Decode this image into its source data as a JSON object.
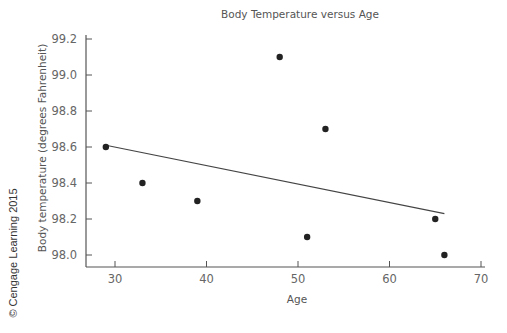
{
  "chart_data": {
    "type": "scatter",
    "title": "Body Temperature versus Age",
    "xlabel": "Age",
    "ylabel": "Body temperature (degrees Fahrenheit)",
    "xlim": [
      27,
      71
    ],
    "ylim": [
      97.93,
      99.26
    ],
    "x_ticks": [
      30,
      40,
      50,
      60,
      70
    ],
    "x_tick_labels": [
      "30",
      "40",
      "50",
      "60",
      "70"
    ],
    "y_ticks": [
      98.0,
      98.2,
      98.4,
      98.6,
      98.8,
      99.0,
      99.2
    ],
    "y_tick_labels": [
      "98.0",
      "98.2",
      "98.4",
      "98.6",
      "98.8",
      "99.0",
      "99.2"
    ],
    "grid": false,
    "legend": null,
    "series": [
      {
        "name": "Observations",
        "type": "scatter",
        "points": [
          {
            "x": 29,
            "y": 98.6
          },
          {
            "x": 33,
            "y": 98.4
          },
          {
            "x": 39,
            "y": 98.3
          },
          {
            "x": 48,
            "y": 99.1
          },
          {
            "x": 51,
            "y": 98.1
          },
          {
            "x": 53,
            "y": 98.7
          },
          {
            "x": 65,
            "y": 98.2
          },
          {
            "x": 66,
            "y": 98.0
          }
        ]
      },
      {
        "name": "Least-squares regression line",
        "type": "line",
        "points": [
          {
            "x": 29,
            "y": 98.61
          },
          {
            "x": 66,
            "y": 98.23
          }
        ]
      }
    ]
  },
  "copyright": "© Cengage Learning 2015",
  "colors": {
    "axis": "#555555",
    "points": "#222222",
    "line": "#444444",
    "text": "#555555"
  }
}
